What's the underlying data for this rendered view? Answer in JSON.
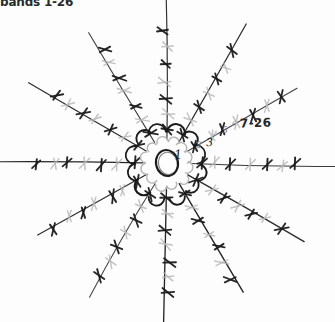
{
  "page": {
    "title_text": "bands 1-26",
    "background_color": "#ffffff",
    "ink_color": "#1b1b1b",
    "faded_ink_color": "#b4b4b4"
  },
  "annotations": {
    "header_label": "bands 1-26",
    "round_note": "7-26",
    "round_1": "1",
    "round_2": "2",
    "round_3": "3",
    "round_4": "4",
    "round_5": "5",
    "round_6": "6"
  },
  "chart_data": {
    "type": "diagram",
    "title": "bands 1-26",
    "subtitle": "",
    "center": {
      "x": 167,
      "y": 163
    },
    "magic_ring": {
      "rx": 11,
      "ry": 13,
      "rotation_deg": -12
    },
    "spoke_count": 12,
    "spoke_angle_step_deg": 30,
    "spoke_start_angle_deg": -90,
    "spoke_inner_radius": 24,
    "spoke_outer_radius": 168,
    "stitch_symbol": "cross",
    "stitches_per_spoke": 7,
    "stitch_radii": [
      34,
      50,
      66,
      82,
      98,
      114,
      130
    ],
    "stitch_shading": [
      "dark",
      "light",
      "dark",
      "light",
      "dark",
      "light",
      "dark"
    ],
    "chain_arc_radius": 40,
    "chain_arc_count": 12,
    "spoke_tip_lengths": [
      170,
      160,
      150,
      168,
      158,
      150,
      165,
      155,
      148,
      170,
      160,
      152
    ],
    "legend": [],
    "xlabel": "",
    "ylabel": ""
  }
}
